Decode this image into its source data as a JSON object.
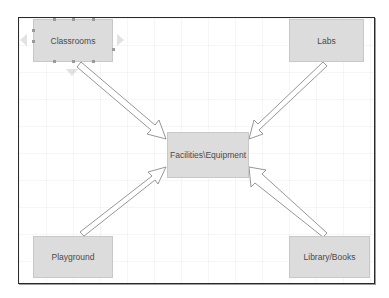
{
  "diagram": {
    "type": "hub-and-spoke",
    "center": {
      "id": "facilities",
      "label": "Facilities\\Equipment"
    },
    "nodes": [
      {
        "id": "classrooms",
        "label": "Classrooms",
        "position": "top-left",
        "selected": true
      },
      {
        "id": "labs",
        "label": "Labs",
        "position": "top-right",
        "selected": false
      },
      {
        "id": "playground",
        "label": "Playground",
        "position": "bottom-left",
        "selected": false
      },
      {
        "id": "library",
        "label": "Library/Books",
        "position": "bottom-right",
        "selected": false
      }
    ],
    "edges": [
      {
        "from": "classrooms",
        "to": "facilities",
        "style": "block-arrow"
      },
      {
        "from": "labs",
        "to": "facilities",
        "style": "block-arrow"
      },
      {
        "from": "playground",
        "to": "facilities",
        "style": "block-arrow"
      },
      {
        "from": "library",
        "to": "facilities",
        "style": "block-arrow"
      }
    ],
    "colors": {
      "node_fill": "#dcdcdc",
      "node_border": "#c8c8c8",
      "text": "#4a4a4a",
      "frame_border": "#2a2a2a",
      "arrow_stroke": "#8a8a8a",
      "arrow_fill": "#ffffff"
    }
  }
}
